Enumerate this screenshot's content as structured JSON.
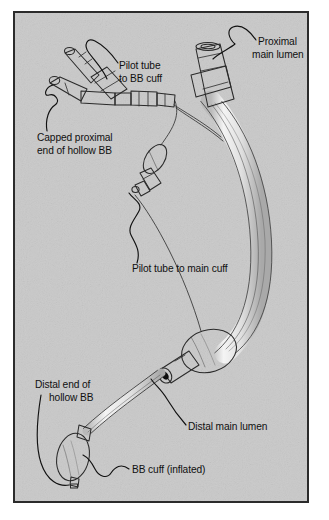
{
  "figure": {
    "background_color": "#c9c9c9",
    "frame_color": "#2b2b2b",
    "ink_color": "#101010",
    "tube_fill": "#e8e8e8"
  },
  "callouts": [
    {
      "id": "pilot-tube-to-bb-cuff",
      "lines": [
        "Pilot tube",
        "to BB cuff"
      ],
      "line1": "Pilot tube",
      "line2": "to BB cuff",
      "text_x": 104,
      "text_y": 56,
      "anchor": "start"
    },
    {
      "id": "proximal-main-lumen",
      "lines": [
        "Proximal",
        "main lumen"
      ],
      "line1": "Proximal",
      "line2": "main lumen",
      "text_x": 243,
      "text_y": 32,
      "anchor": "start"
    },
    {
      "id": "capped-proximal-end-of-hollow-bb",
      "lines": [
        "Capped proximal",
        "end of hollow BB"
      ],
      "line1": "Capped proximal",
      "line2": "end of hollow BB",
      "text_x": 22,
      "text_y": 128,
      "anchor": "start"
    },
    {
      "id": "pilot-tube-to-main-cuff",
      "lines": [
        "Pilot tube to main cuff"
      ],
      "line1": "Pilot tube to main cuff",
      "line2": "",
      "text_x": 117,
      "text_y": 259,
      "anchor": "start"
    },
    {
      "id": "distal-end-of-hollow-bb",
      "lines": [
        "Distal end of",
        "hollow BB"
      ],
      "line1": "Distal end of",
      "line2": "hollow BB",
      "text_x": 20,
      "text_y": 375,
      "anchor": "start"
    },
    {
      "id": "distal-main-lumen",
      "lines": [
        "Distal main lumen"
      ],
      "line1": "Distal main lumen",
      "line2": "",
      "text_x": 173,
      "text_y": 417,
      "anchor": "start"
    },
    {
      "id": "bb-cuff-inflated",
      "lines": [
        "BB cuff (inflated)"
      ],
      "line1": "BB cuff (inflated)",
      "line2": "",
      "text_x": 117,
      "text_y": 460,
      "anchor": "start"
    }
  ]
}
